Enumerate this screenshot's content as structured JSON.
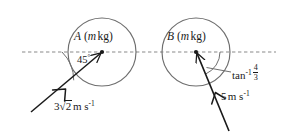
{
  "diagram": {
    "type": "mechanics-collision-diagram",
    "canvas": {
      "width": 290,
      "height": 134
    },
    "colors": {
      "stroke": "#6e6e6e",
      "vector": "#1a1a1a",
      "text": "#1a1a1a",
      "background": "#ffffff",
      "dashed_line": "#8a8a8a"
    },
    "reference_line": {
      "name": "line-of-centres",
      "style": "dashed",
      "y": 52,
      "x_start": 22,
      "x_end": 276
    },
    "particles": [
      {
        "id": "A",
        "label_letter": "A",
        "label_mass": "m",
        "label_unit": "kg",
        "label_full": "A (m kg)",
        "center": {
          "x": 102,
          "y": 52
        },
        "radius": 34
      },
      {
        "id": "B",
        "label_letter": "B",
        "label_mass": "m",
        "label_unit": "kg",
        "label_full": "B (m kg)",
        "center": {
          "x": 196,
          "y": 52
        },
        "radius": 34
      }
    ],
    "vectors": [
      {
        "name": "velocity-vector-a",
        "for_particle": "A",
        "speed_value": "3",
        "speed_radical": "2",
        "speed_units": "m s",
        "speed_exponent": "-1",
        "speed_label": "3√2 m s⁻¹",
        "angle_label": "45",
        "angle_symbol": "°",
        "angle_full": "45°",
        "angle_degrees": 45,
        "direction": "up-and-right",
        "tail": {
          "x": 31,
          "y": 112
        },
        "head": {
          "x": 102,
          "y": 52
        }
      },
      {
        "name": "velocity-vector-b",
        "for_particle": "B",
        "speed_value": "5",
        "speed_units": "m s",
        "speed_exponent": "-1",
        "speed_label": "5 m s⁻¹",
        "angle_label": "tan",
        "angle_exponent": "-1",
        "angle_numerator": "4",
        "angle_denominator": "3",
        "angle_full": "tan⁻¹ 4/3",
        "angle_degrees": 53.13,
        "direction": "up-and-left",
        "tail": {
          "x": 229,
          "y": 131
        },
        "head": {
          "x": 196,
          "y": 52
        }
      }
    ],
    "angle_arcs": [
      {
        "name": "angle-arc-a",
        "at_particle": "A",
        "radius": 40
      },
      {
        "name": "angle-arc-b",
        "at_particle": "B",
        "radius": 24
      }
    ],
    "leader_lines": [
      {
        "name": "leader-line-angle-b",
        "from": {
          "x": 207,
          "y": 68
        },
        "to": {
          "x": 231,
          "y": 72
        }
      }
    ]
  }
}
